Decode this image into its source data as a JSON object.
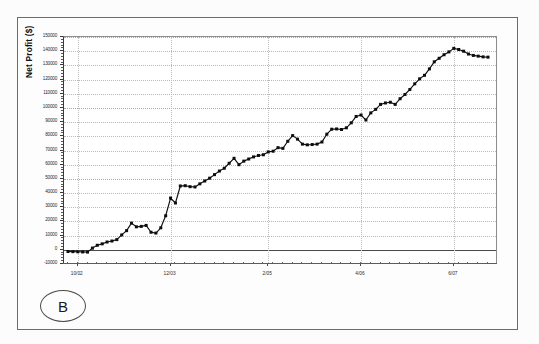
{
  "panel": {
    "letter": "B"
  },
  "chart_data": {
    "type": "line",
    "title": "",
    "xlabel": "",
    "ylabel": "Net Profit ($)",
    "ylim": [
      -10000,
      150000
    ],
    "grid": true,
    "legend": "none",
    "marker": "filled-square",
    "line_color": "#111111",
    "y_ticklabels": [
      "150000",
      "140000",
      "130000",
      "120000",
      "110000",
      "100000",
      "90000",
      "80000",
      "70000",
      "60000",
      "50000",
      "40000",
      "30000",
      "20000",
      "10000",
      "0",
      "-10000"
    ],
    "y_tickvalues": [
      150000,
      140000,
      130000,
      120000,
      110000,
      100000,
      90000,
      80000,
      70000,
      60000,
      50000,
      40000,
      30000,
      20000,
      10000,
      0,
      -10000
    ],
    "x_ticklabels": [
      "10/02",
      "12/03",
      "2/05",
      "4/06",
      "6/07"
    ],
    "x_tickpositions": [
      2,
      21,
      41,
      60,
      79
    ],
    "x_index": [
      0,
      1,
      2,
      3,
      4,
      5,
      6,
      7,
      8,
      9,
      10,
      11,
      12,
      13,
      14,
      15,
      16,
      17,
      18,
      19,
      20,
      21,
      22,
      23,
      24,
      25,
      26,
      27,
      28,
      29,
      30,
      31,
      32,
      33,
      34,
      35,
      36,
      37,
      38,
      39,
      40,
      41,
      42,
      43,
      44,
      45,
      46,
      47,
      48,
      49,
      50,
      51,
      52,
      53,
      54,
      55,
      56,
      57,
      58,
      59,
      60,
      61,
      62,
      63,
      64,
      65,
      66,
      67,
      68,
      69,
      70,
      71,
      72,
      73,
      74,
      75,
      76,
      77,
      78,
      79,
      80,
      81,
      82,
      83,
      84,
      85,
      86
    ],
    "values": [
      -1200,
      -1300,
      -1400,
      -1500,
      -1600,
      1200,
      3200,
      4200,
      5500,
      6200,
      7200,
      10500,
      13500,
      18800,
      16200,
      16500,
      17200,
      12400,
      11800,
      15500,
      24000,
      36500,
      33000,
      45000,
      45200,
      44500,
      44300,
      46500,
      48500,
      50500,
      53000,
      55500,
      57500,
      61000,
      64500,
      60000,
      62500,
      64000,
      65500,
      66500,
      67000,
      69000,
      69500,
      72000,
      71500,
      76500,
      80500,
      78000,
      74500,
      74000,
      74200,
      74500,
      76000,
      81500,
      85000,
      85200,
      84800,
      86000,
      89500,
      94000,
      95000,
      91500,
      96500,
      99000,
      102500,
      103500,
      104000,
      102500,
      106500,
      109500,
      113000,
      117000,
      120500,
      123000,
      127500,
      132500,
      135000,
      137500,
      139500,
      142000,
      141200,
      140000,
      138000,
      137000,
      136500,
      136000,
      135800
    ]
  }
}
